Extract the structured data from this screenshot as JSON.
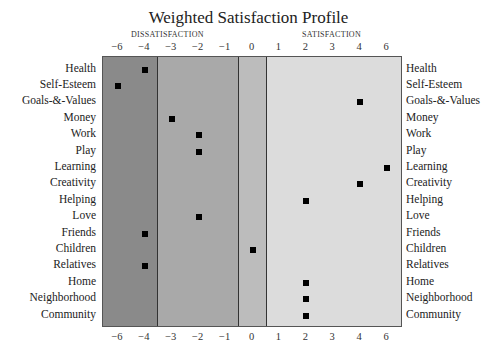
{
  "chart_data": {
    "type": "scatter",
    "title": "Weighted Satisfaction Profile",
    "section_labels": {
      "left": "DISSATISFACTION",
      "right": "SATISFACTION"
    },
    "x_ticks": [
      "−6",
      "−4",
      "−3",
      "−2",
      "−1",
      "0",
      "1",
      "2",
      "3",
      "4",
      "6"
    ],
    "x_tick_values": [
      -6,
      -4,
      -3,
      -2,
      -1,
      0,
      1,
      2,
      3,
      4,
      6
    ],
    "bands": [
      {
        "from": -6,
        "to": -4,
        "color": "#8a8a8a"
      },
      {
        "from": -3,
        "to": -1,
        "color": "#a9a9a9"
      },
      {
        "from": 0,
        "to": 0,
        "color": "#bcbcbc"
      },
      {
        "from": 1,
        "to": 6,
        "color": "#dcdcdc"
      }
    ],
    "categories": [
      "Health",
      "Self-Esteem",
      "Goals-&-Values",
      "Money",
      "Work",
      "Play",
      "Learning",
      "Creativity",
      "Helping",
      "Love",
      "Friends",
      "Children",
      "Relatives",
      "Home",
      "Neighborhood",
      "Community"
    ],
    "values": [
      -4,
      -6,
      4,
      -3,
      -2,
      -2,
      6,
      4,
      2,
      -2,
      -4,
      0,
      -4,
      2,
      2,
      2
    ],
    "xlabel": "",
    "ylabel": "",
    "xlim": [
      -6,
      6
    ],
    "grid": false,
    "legend": null
  }
}
